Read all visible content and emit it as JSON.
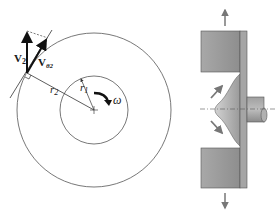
{
  "left_figure": {
    "labels": {
      "v2": "V",
      "v2_sub": "2",
      "vtheta2": "V",
      "vtheta2_sub": "θ2",
      "r2": "r",
      "r2_sub": "2",
      "r1": "r",
      "r1_sub": "1",
      "omega": "ω"
    }
  },
  "right_figure": {
    "description": "cross-section of impeller with shaft and flow arrows"
  },
  "colors": {
    "line": "#333333",
    "vector": "#111111",
    "block_fill": "#9a9a9a",
    "block_light": "#b5b5b5",
    "arrow_gray": "#7a7a7a"
  }
}
